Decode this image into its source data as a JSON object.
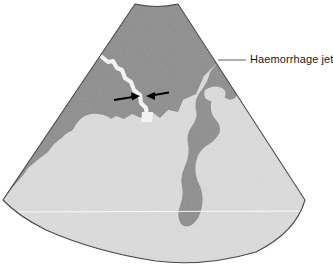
{
  "figure": {
    "kind": "ultrasound-sector-scan-diagram",
    "caption_label": "Haemorrhage jet",
    "annotation": {
      "label": "Haemorrhage jet",
      "leader_line": {
        "from_x": 218,
        "from_y": 60,
        "to_x": 246,
        "to_y": 60,
        "color": "#6e6e6e"
      },
      "arrows": [
        {
          "name": "left-arrow",
          "tail_x": 114,
          "tail_y": 100,
          "tip_x": 139,
          "tip_y": 96,
          "direction": "right"
        },
        {
          "name": "right-arrow",
          "tail_x": 168,
          "tail_y": 93,
          "tip_x": 147,
          "tip_y": 96,
          "direction": "left"
        }
      ]
    },
    "colors": {
      "background": "#ffffff",
      "sector_light_tissue": "#dcdcdc",
      "sector_dark_tissue": "#8d8d8d",
      "jet_white": "#f2f2f2",
      "sector_outline": "#4a4a4a",
      "arrow_black": "#000000",
      "leader_line": "#6e6e6e",
      "depth_marker_line": "#fbfbfb",
      "text": "#1a1a1a"
    },
    "geometry": {
      "apex_top_left_x": 135,
      "apex_top_right_x": 178,
      "apex_top_y": 4,
      "left_extent_x": 3,
      "right_extent_x": 305,
      "widest_y": 200,
      "bottom_arc_y": 261,
      "depth_marker_y": 212
    },
    "regions": [
      {
        "name": "dark-tissue-upper",
        "tone": "dark",
        "description": "large dark echo-poor area filling the upper and left portion of the sector"
      },
      {
        "name": "dark-tissue-right-band",
        "tone": "dark",
        "description": "dark band descending from upper right toward the lower sector"
      },
      {
        "name": "light-tissue-lower",
        "tone": "light",
        "description": "bright echogenic tissue filling the lower half of the sector"
      },
      {
        "name": "haemorrhage-jet-channel",
        "tone": "white",
        "description": "narrow bright zigzag jet running from upper left down into the light tissue"
      }
    ]
  }
}
